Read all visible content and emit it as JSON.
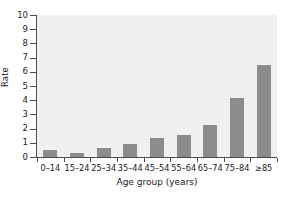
{
  "chart_data": {
    "type": "bar",
    "title": "",
    "subtitle": "",
    "xlabel": "Age group (years)",
    "ylabel": "Rate",
    "categories": [
      "0–14",
      "15–24",
      "25–34",
      "35–44",
      "45–54",
      "55–64",
      "65–74",
      "75–84",
      "≥85"
    ],
    "values": [
      0.5,
      0.25,
      0.6,
      0.95,
      1.35,
      1.55,
      2.25,
      4.15,
      6.45
    ],
    "ylim": [
      0,
      10
    ],
    "yticks": [
      0,
      1,
      2,
      3,
      4,
      5,
      6,
      7,
      8,
      9,
      10
    ],
    "ytick_labels": [
      "0",
      "1",
      "2",
      "3",
      "4",
      "5",
      "6",
      "7",
      "8",
      "9",
      "10"
    ],
    "grid": false,
    "legend": null,
    "legend_position": "none",
    "bar_color": "#8c8c8c",
    "plot_background": "#f0f0f0",
    "axis_color": "#4d4d4d",
    "figure_background": "#ffffff"
  }
}
